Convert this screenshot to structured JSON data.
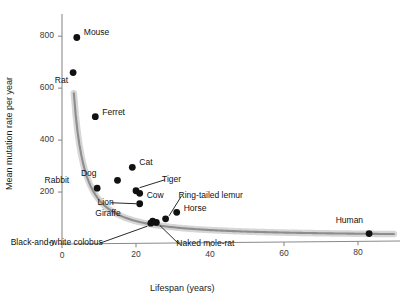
{
  "chart_data": {
    "type": "scatter",
    "title": "",
    "xlabel": "Lifespan (years)",
    "ylabel": "Mean mutation rate per year",
    "xlim": [
      0,
      90
    ],
    "ylim": [
      0,
      870
    ],
    "xticks": [
      0,
      20,
      40,
      60,
      80
    ],
    "yticks": [
      0,
      200,
      400,
      600,
      800
    ],
    "xtick_labels": [
      "0",
      "20",
      "40",
      "60",
      "80"
    ],
    "ytick_labels": [
      "0",
      "200",
      "400",
      "600",
      "800"
    ],
    "grid": false,
    "legend": "none",
    "points": [
      {
        "name": "Mouse",
        "x": 4,
        "y": 795,
        "label_dx": 7,
        "label_dy": -4,
        "leader": false
      },
      {
        "name": "Rat",
        "x": 3,
        "y": 660,
        "label_dx": -5,
        "label_dy": 8,
        "leader": false
      },
      {
        "name": "Ferret",
        "x": 9,
        "y": 490,
        "label_dx": 7,
        "label_dy": -4,
        "leader": false
      },
      {
        "name": "Cat",
        "x": 19,
        "y": 295,
        "label_dx": 7,
        "label_dy": -4,
        "leader": false
      },
      {
        "name": "Dog",
        "x": 15,
        "y": 245,
        "label_dx": -21,
        "label_dy": -6,
        "leader": false
      },
      {
        "name": "Rabbit",
        "x": 9.5,
        "y": 215,
        "label_dx": -28,
        "label_dy": -7,
        "leader": false
      },
      {
        "name": "Tiger",
        "x": 20,
        "y": 205,
        "label_dx": 26,
        "label_dy": -11,
        "leader": true
      },
      {
        "name": "Cow",
        "x": 21,
        "y": 195,
        "label_dx": 7,
        "label_dy": 3,
        "leader": false
      },
      {
        "name": "Lion",
        "x": 21,
        "y": 155,
        "label_dx": -26,
        "label_dy": -1,
        "leader": true
      },
      {
        "name": "Horse",
        "x": 31,
        "y": 122,
        "label_dx": 7,
        "label_dy": -3,
        "leader": false
      },
      {
        "name": "Ring-tailed lemur",
        "x": 28,
        "y": 97,
        "label_dx": 13,
        "label_dy": -23,
        "leader": true
      },
      {
        "name": "Giraffe",
        "x": 24.5,
        "y": 88,
        "label_dx": -32,
        "label_dy": -7,
        "leader": false
      },
      {
        "name": "Black-and-white colobus",
        "x": 24,
        "y": 80,
        "label_dx": -48,
        "label_dy": 20,
        "leader": true
      },
      {
        "name": "Naked mole-rat",
        "x": 25.5,
        "y": 83,
        "label_dx": 20,
        "label_dy": 22,
        "leader": true
      },
      {
        "name": "Human",
        "x": 83,
        "y": 40,
        "label_dx": -6,
        "label_dy": -13,
        "leader": false
      }
    ],
    "fit_curve": {
      "description": "decaying power-law trend line with shaded confidence band",
      "color": "#8d8d8d",
      "band_color": "#cfcfcf"
    },
    "colors": {
      "point": "#111111",
      "axis": "#8a8a8a",
      "text": "#1a1a1a"
    }
  }
}
